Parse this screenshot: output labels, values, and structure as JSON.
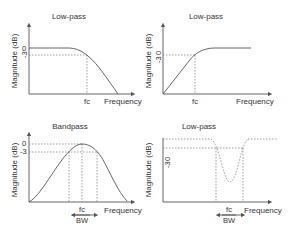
{
  "colors": {
    "line": "#555555",
    "text": "#333333",
    "guide": "#777777",
    "background": "#ffffff"
  },
  "panels": [
    {
      "id": "top-left",
      "title": "Low-pass",
      "ylabel": "Magnitude (dB)",
      "xlabel": "Frequency",
      "ticks": {
        "zero": "0",
        "minus3": "-3",
        "fc": "fc"
      }
    },
    {
      "id": "top-right",
      "title": "Low-pass",
      "ylabel": "Magnitude (dB)",
      "xlabel": "Frequency",
      "ticks": {
        "zero": "0",
        "minus3": "-3",
        "fc": "fc"
      }
    },
    {
      "id": "bottom-left",
      "title": "Bandpass",
      "ylabel": "Magnitude (dB)",
      "xlabel": "Frequency",
      "ticks": {
        "zero": "0",
        "minus3": "-3",
        "fc": "fc",
        "bw": "BW"
      }
    },
    {
      "id": "bottom-right",
      "title": "Low-pass",
      "ylabel": "Magnitude (dB)",
      "xlabel": "Frequency",
      "ticks": {
        "zero": "0",
        "minus3": "-3",
        "fc": "fc",
        "bw": "BW"
      }
    }
  ]
}
